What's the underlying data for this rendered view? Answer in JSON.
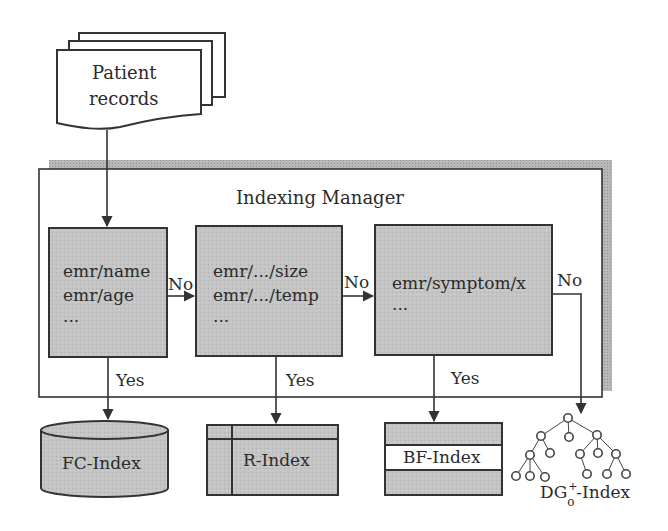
{
  "diagram": {
    "source": {
      "label_line1": "Patient",
      "label_line2": "records"
    },
    "manager": {
      "title": "Indexing Manager"
    },
    "rules": [
      {
        "lines": [
          "emr/name",
          "emr/age",
          "..."
        ]
      },
      {
        "lines": [
          "emr/.../size",
          "emr/.../temp",
          "..."
        ]
      },
      {
        "lines": [
          "emr/symptom/x",
          "..."
        ]
      }
    ],
    "edges": {
      "no_1": "No",
      "no_2": "No",
      "no_3": "No",
      "yes_1": "Yes",
      "yes_2": "Yes",
      "yes_3": "Yes"
    },
    "indexes": {
      "fc": "FC-Index",
      "r": "R-Index",
      "bf": "BF-Index",
      "dg_base": "DG",
      "dg_sup": "+",
      "dg_sub": "o",
      "dg_suffix": "-Index"
    },
    "colors": {
      "box_fill": "#c9c9c9",
      "stroke": "#333333",
      "shadow": "#b5b5b5",
      "background": "#ffffff"
    }
  }
}
